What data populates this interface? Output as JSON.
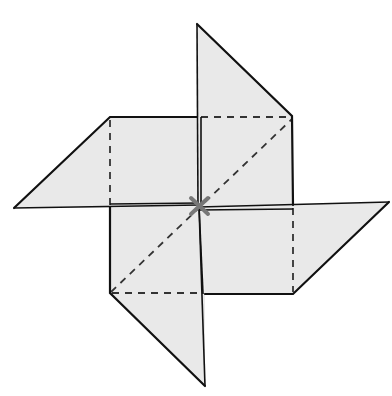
{
  "diagram": {
    "colors": {
      "paper_fill": "#e9e9e9",
      "outline": "#111111",
      "fold_line": "#333333",
      "center_mark": "#777777",
      "background": "#ffffff"
    },
    "center": [
      199,
      206
    ],
    "square": {
      "left": 110,
      "top": 117,
      "right": 293,
      "bottom": 294
    },
    "flaps": [
      {
        "name": "top-flap",
        "tip": [
          197,
          24
        ],
        "corner": [
          292,
          116
        ]
      },
      {
        "name": "right-flap",
        "tip": [
          389,
          202
        ],
        "corner": [
          293,
          294
        ]
      },
      {
        "name": "bottom-flap",
        "tip": [
          205,
          386
        ],
        "corner": [
          110,
          293
        ]
      },
      {
        "name": "left-flap",
        "tip": [
          14,
          208
        ],
        "corner": [
          110,
          117
        ]
      }
    ],
    "fold_lines": [
      {
        "type": "dashed",
        "from": [
          197,
          117
        ],
        "to": [
          293,
          117
        ]
      },
      {
        "type": "dashed",
        "from": [
          110,
          117
        ],
        "to": [
          110,
          208
        ]
      },
      {
        "type": "dashed",
        "from": [
          293,
          204
        ],
        "to": [
          293,
          294
        ]
      },
      {
        "type": "dashed",
        "from": [
          110,
          293
        ],
        "to": [
          205,
          293
        ]
      },
      {
        "type": "dashed",
        "from": [
          110,
          293
        ],
        "to": [
          293,
          117
        ]
      }
    ],
    "center_mark_label": "×"
  }
}
